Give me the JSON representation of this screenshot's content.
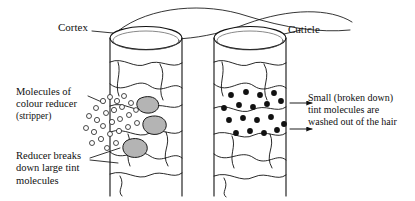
{
  "diagram": {
    "background_color": "#ffffff",
    "ink_color": "#111111",
    "blob_fill_color": "#b4b4b4",
    "labels": {
      "cortex": "Cortex",
      "cuticle": "Cuticle",
      "reducer_line1": "Molecules of",
      "reducer_line2": "colour reducer",
      "reducer_line3": "(stripper)",
      "breaks_line1": "Reducer breaks",
      "breaks_line2": "down large tint",
      "breaks_line3": "molecules",
      "washed_line1": "Small (broken down)",
      "washed_line2": "tint molecules are",
      "washed_line3": "washed out of the hair"
    },
    "left_shaft": {
      "name": "hair-shaft-left",
      "small_circles_count": 26,
      "large_tint_blobs_count": 3
    },
    "right_shaft": {
      "name": "hair-shaft-right",
      "black_dots_count": 18,
      "escape_arrows": 2
    }
  }
}
